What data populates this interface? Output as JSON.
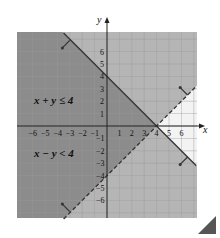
{
  "chart_data": {
    "type": "region",
    "title": "",
    "xlabel": "x",
    "ylabel": "y",
    "xlim": [
      -7.26,
      7.26
    ],
    "ylim": [
      -7.4,
      7.58
    ],
    "grid": true,
    "x_ticks": [
      -6,
      -5,
      -4,
      -3,
      -2,
      -1,
      1,
      2,
      3,
      4,
      5,
      6
    ],
    "y_ticks": [
      -6,
      -5,
      -4,
      -3,
      -2,
      -1,
      1,
      2,
      3,
      4,
      5,
      6
    ],
    "x_tick_labels": [
      "−6",
      "−5",
      "−4",
      "−3",
      "−2",
      "−1",
      "1",
      "2",
      "3",
      "4",
      "5",
      "6"
    ],
    "y_tick_labels": [
      "−6",
      "−5",
      "−4",
      "−3",
      "−2",
      "−1",
      "1",
      "2",
      "3",
      "4",
      "5",
      "6"
    ],
    "series": [
      {
        "name": "x + y = 4",
        "style": "solid",
        "points": [
          [
            -3.5,
            7.5
          ],
          [
            7.2,
            -3.2
          ]
        ],
        "inequality": "x + y ≤ 4",
        "shade": "below"
      },
      {
        "name": "x − y = 4",
        "style": "dashed",
        "points": [
          [
            -3.5,
            -7.5
          ],
          [
            7.2,
            3.2
          ]
        ],
        "inequality": "x − y < 4",
        "shade": "above"
      }
    ],
    "annotations": [
      {
        "text": "x + y ≤ 4",
        "x": -4.6,
        "y": 2.3
      },
      {
        "text": "x − y < 4",
        "x": -4.6,
        "y": -2.1
      }
    ],
    "intersection": [
      4,
      0
    ]
  },
  "labels": {
    "x_axis": "x",
    "y_axis": "y",
    "ineq1": "x + y ≤ 4",
    "ineq2": "x − y < 4"
  },
  "colors": {
    "overlap": "#8c8c8c",
    "single": "#b5b5b5",
    "none": "#f3f3f3",
    "grid": "#9a9a9a",
    "axis": "#222222",
    "line": "#333333"
  }
}
